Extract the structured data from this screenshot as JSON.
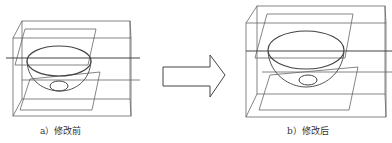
{
  "figure": {
    "panel_a": {
      "caption": "a）修改前",
      "state": "before modification"
    },
    "panel_b": {
      "caption": "b）修改后",
      "state": "after modification"
    },
    "arrow": {
      "direction": "right"
    },
    "colors": {
      "line": "#555555",
      "background": "#ffffff"
    }
  }
}
